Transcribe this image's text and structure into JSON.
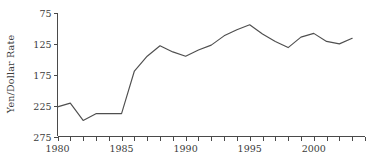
{
  "chart_data": {
    "type": "line",
    "title": "",
    "xlabel": "",
    "ylabel": "Yen/Dollar Rate",
    "x": [
      1980,
      1981,
      1982,
      1983,
      1984,
      1985,
      1986,
      1987,
      1988,
      1989,
      1990,
      1991,
      1992,
      1993,
      1994,
      1995,
      1996,
      1997,
      1998,
      1999,
      2000,
      2001,
      2002,
      2003
    ],
    "values": [
      227,
      221,
      249,
      238,
      238,
      238,
      169,
      145,
      128,
      138,
      145,
      135,
      127,
      112,
      102,
      94,
      109,
      121,
      131,
      114,
      108,
      121,
      125,
      116
    ],
    "series": [
      {
        "name": "Yen/Dollar Rate",
        "values": [
          227,
          221,
          249,
          238,
          238,
          238,
          169,
          145,
          128,
          138,
          145,
          135,
          127,
          112,
          102,
          94,
          109,
          121,
          131,
          114,
          108,
          121,
          125,
          116
        ]
      }
    ],
    "xlim": [
      1980,
      2004
    ],
    "ylim": [
      275,
      75
    ],
    "y_axis_inverted": true,
    "yticks": [
      75,
      125,
      175,
      225,
      275
    ],
    "yticklabels": [
      "75",
      "125",
      "175",
      "225",
      "275"
    ],
    "xticks": [
      1980,
      1981,
      1982,
      1983,
      1984,
      1985,
      1986,
      1987,
      1988,
      1989,
      1990,
      1991,
      1992,
      1993,
      1994,
      1995,
      1996,
      1997,
      1998,
      1999,
      2000,
      2001,
      2002,
      2003,
      2004
    ],
    "xticklabels_shown": [
      {
        "value": 1980,
        "label": "1980"
      },
      {
        "value": 1985,
        "label": "1985"
      },
      {
        "value": 1990,
        "label": "1990"
      },
      {
        "value": 1995,
        "label": "1995"
      },
      {
        "value": 2000,
        "label": "2000"
      }
    ],
    "grid": false,
    "legend": false,
    "line_color": "#4f4f4f",
    "axis_color": "#4a4a4a",
    "background_color": "#ffffff"
  },
  "axes": {
    "ylabel": "Yen/Dollar Rate",
    "ytick_labels": [
      "75",
      "125",
      "175",
      "225",
      "275"
    ],
    "xtick_labels": [
      "1980",
      "1985",
      "1990",
      "1995",
      "2000"
    ]
  }
}
